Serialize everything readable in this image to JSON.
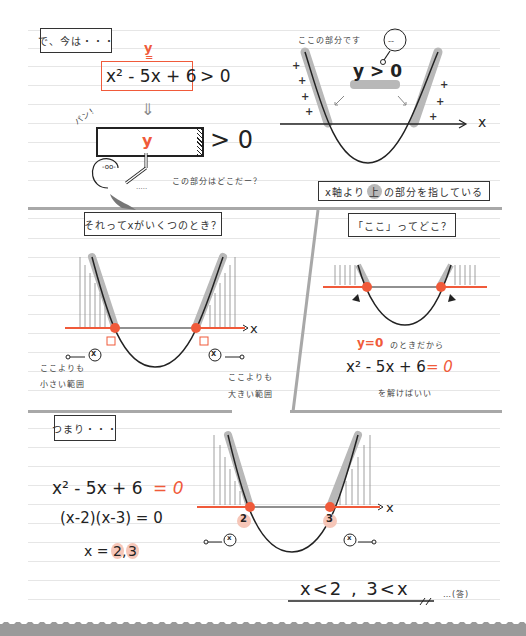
{
  "section1": {
    "label": "で、今は・・・",
    "y_label": "y",
    "equals_mark": "=",
    "expression": "x² - 5x + 6",
    "inequality": "> 0",
    "down_arrow": "⇓",
    "pan_label": "パン!",
    "block_y": "y",
    "block_inequality": "> 0",
    "caption": "この部分はどこだー？"
  },
  "section1_graph": {
    "caption": "ここの部分です",
    "highlight": "y > 0",
    "x_axis_label": "x",
    "plus_sign": "+"
  },
  "section1_conclusion": {
    "prefix": "x軸より",
    "highlighted_word": "上",
    "suffix": "の部分を指している"
  },
  "section2": {
    "label": "それってxがいくつのとき？",
    "x_axis_label": "x",
    "left_note_line1": "ここよりも",
    "left_note_line2": "小さい範囲",
    "right_note_line1": "ここよりも",
    "right_note_line2": "大きい範囲",
    "bubble_x": "x"
  },
  "section3": {
    "label": "「ここ」ってどこ？",
    "y_equals_zero": "y=0",
    "condition_text": "のときだから",
    "equation_left": "x² - 5x + 6",
    "equation_right": "= 0",
    "solve_text": "を解けばいい"
  },
  "section4": {
    "label": "つまり・・・",
    "eq1_left": "x² - 5x + 6",
    "eq1_right": "= 0",
    "eq2": "(x-2)(x-3) = 0",
    "eq3_prefix": "x =",
    "root1": "2",
    "root_sep": ",",
    "root2": "3",
    "graph_root1": "2",
    "graph_root2": "3",
    "x_axis_label": "x",
    "bubble_x": "x",
    "answer": "x<2 , 3<x",
    "answer_suffix": "…(答)"
  },
  "colors": {
    "accent_red": "#f05a3a",
    "highlight_gray": "#b8b8b8",
    "divider_gray": "#a8a8a8",
    "ink": "#222222",
    "root_pink": "#f6c6b8"
  }
}
